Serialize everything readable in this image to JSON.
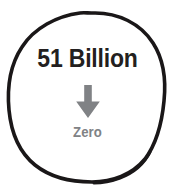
{
  "canvas": {
    "width": 175,
    "height": 196,
    "background_color": "#ffffff"
  },
  "graphic": {
    "type": "hand-drawn-circle-callout",
    "circle": {
      "stroke_color": "#1a1718",
      "fill_color": "#ffffff",
      "style": "hand-drawn irregular outline"
    }
  },
  "headline": {
    "text": "51 Billion",
    "color": "#231f20"
  },
  "arrow": {
    "icon_name": "arrow-down-icon",
    "direction": "down",
    "color": "#808285"
  },
  "footnote": {
    "text": "Zero",
    "color": "#808285"
  }
}
